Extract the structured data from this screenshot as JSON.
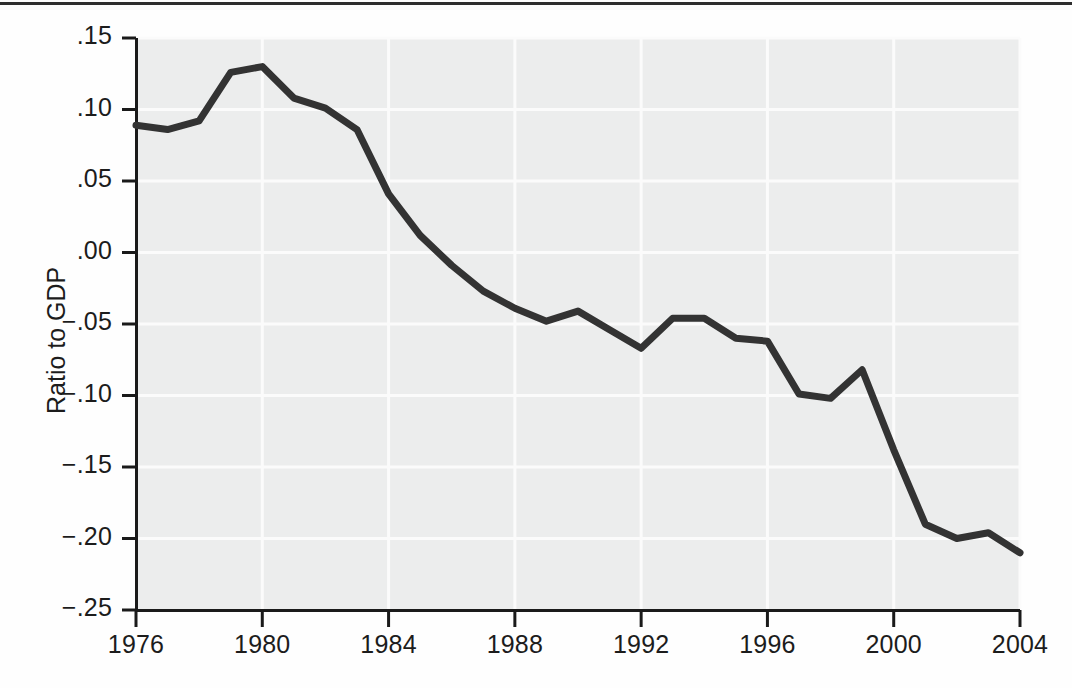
{
  "figure": {
    "kind": "line-chart",
    "background": "#fefefe",
    "plot_background": "#eceded",
    "line_color": "#333333",
    "axis_color": "#1a1a1a",
    "grid_color": "#fbfbfb",
    "top_rule_color": "#2e2e2e"
  },
  "axes": {
    "y_title": "Ratio to GDP",
    "y_tick_labels": [
      ".15",
      ".10",
      ".05",
      ".00",
      "−.05",
      "−.10",
      "−.15",
      "−.20",
      "−.25"
    ],
    "x_tick_labels": [
      "1976",
      "1980",
      "1984",
      "1988",
      "1992",
      "1996",
      "2000",
      "2004"
    ]
  },
  "chart_data": {
    "type": "line",
    "title": "",
    "subtitle": "",
    "xlabel": "",
    "ylabel": "Ratio to GDP",
    "xlim": [
      1976,
      2004
    ],
    "ylim": [
      -0.25,
      0.15
    ],
    "grid": true,
    "legend": null,
    "xticks": [
      1976,
      1980,
      1984,
      1988,
      1992,
      1996,
      2000,
      2004
    ],
    "yticks": [
      0.15,
      0.1,
      0.05,
      0.0,
      -0.05,
      -0.1,
      -0.15,
      -0.2,
      -0.25
    ],
    "x": [
      1976,
      1977,
      1978,
      1979,
      1980,
      1981,
      1982,
      1983,
      1984,
      1985,
      1986,
      1987,
      1988,
      1989,
      1990,
      1991,
      1992,
      1993,
      1994,
      1995,
      1996,
      1997,
      1998,
      1999,
      2000,
      2001,
      2002,
      2003,
      2004
    ],
    "series": [
      {
        "name": "Ratio to GDP",
        "values": [
          0.089,
          0.086,
          0.092,
          0.126,
          0.13,
          0.108,
          0.101,
          0.086,
          0.041,
          0.012,
          -0.009,
          -0.027,
          -0.039,
          -0.048,
          -0.041,
          -0.054,
          -0.067,
          -0.046,
          -0.046,
          -0.06,
          -0.062,
          -0.099,
          -0.102,
          -0.082,
          -0.138,
          -0.19,
          -0.2,
          -0.196,
          -0.21
        ]
      }
    ]
  }
}
